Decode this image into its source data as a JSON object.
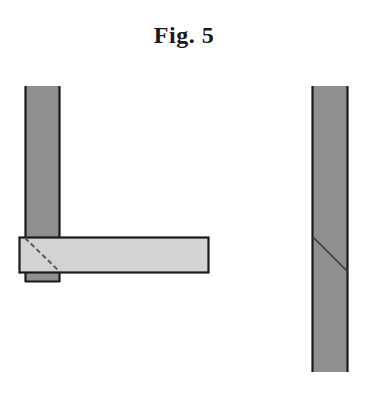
{
  "figure": {
    "title": "Fig. 5"
  },
  "colors": {
    "background": "#ffffff",
    "stroke": "#1a1a1a",
    "post_fill": "#8f8f8f",
    "board_fill": "#d3d3d3",
    "hidden_line": "#5a5a5a",
    "cut_line": "#3a3a3a"
  },
  "shapes": {
    "left_post": {
      "x": 25,
      "y": 86,
      "width": 35,
      "height": 196
    },
    "board": {
      "x": 19,
      "y": 237,
      "width": 190,
      "height": 36
    },
    "hidden_diagonal": {
      "x1": 25,
      "y1": 237,
      "x2": 60,
      "y2": 273,
      "style": "dashed"
    },
    "right_post": {
      "x": 312,
      "y": 86,
      "width": 36,
      "height": 286
    },
    "right_diagonal": {
      "x1": 313,
      "y1": 237,
      "x2": 348,
      "y2": 272,
      "style": "solid"
    }
  }
}
